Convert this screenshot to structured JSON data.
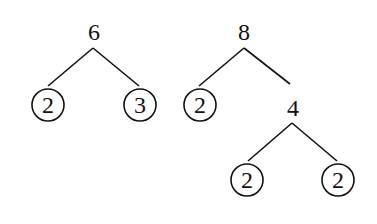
{
  "diagram": {
    "type": "factor-trees",
    "trees": [
      {
        "root": "6",
        "children": [
          {
            "value": "2",
            "prime": true
          },
          {
            "value": "3",
            "prime": true
          }
        ]
      },
      {
        "root": "8",
        "children": [
          {
            "value": "2",
            "prime": true
          },
          {
            "value": "4",
            "prime": false,
            "children": [
              {
                "value": "2",
                "prime": true
              },
              {
                "value": "2",
                "prime": true
              }
            ]
          }
        ]
      }
    ]
  },
  "labels": {
    "t1_root": "6",
    "t1_left": "2",
    "t1_right": "3",
    "t2_root": "8",
    "t2_left": "2",
    "t2_mid": "4",
    "t2_mid_left": "2",
    "t2_mid_right": "2"
  }
}
